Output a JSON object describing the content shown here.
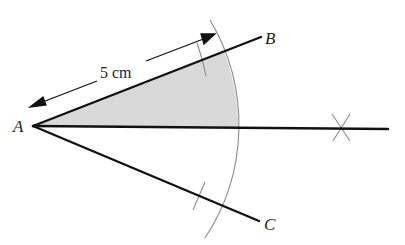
{
  "diagram": {
    "type": "geometric-construction",
    "points": {
      "A": {
        "label": "A",
        "x": 33,
        "y": 126
      },
      "B": {
        "label": "B",
        "x": 261,
        "y": 37
      },
      "C": {
        "label": "C",
        "x": 259,
        "y": 221
      },
      "bisector_end": {
        "x": 388,
        "y": 128
      }
    },
    "measurement": {
      "label": "5 cm",
      "from": "A",
      "along": "AB"
    },
    "colors": {
      "line": "#111111",
      "construction": "#888888",
      "shade": "#d9d9d9",
      "text": "#222222"
    },
    "arc_radius": 205
  }
}
